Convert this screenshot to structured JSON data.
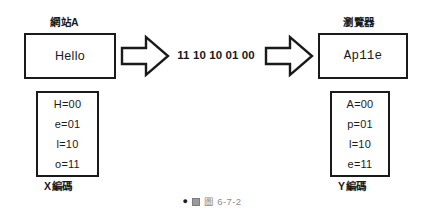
{
  "figure": {
    "caption_icon": "image-placeholder-icon",
    "caption_text": "圖 6-7-2"
  },
  "source_node": {
    "title": "網站A",
    "content": "Hello"
  },
  "destination_node": {
    "title": "瀏覽器",
    "content": "Ap11e"
  },
  "transmission": {
    "binary": "11 10 10 01 00",
    "arrow_left": "arrow-right-icon",
    "arrow_right": "arrow-right-icon"
  },
  "encoding_x": {
    "caption": "X編碼",
    "rows": [
      "H=00",
      "e=01",
      "l=10",
      "o=11"
    ]
  },
  "encoding_y": {
    "caption": "Y編碼",
    "rows": [
      "A=00",
      "p=01",
      "l=10",
      "e=11"
    ]
  },
  "colors": {
    "stroke": "#1a1a1a",
    "background": "#ffffff",
    "caption_text": "#8c8c8c"
  }
}
